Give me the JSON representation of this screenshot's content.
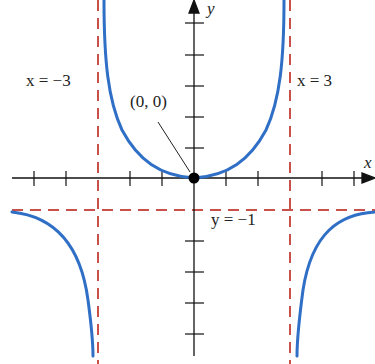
{
  "diagram": {
    "type": "function-graph",
    "function_description": "rational function with vertical asymptotes x = ±3 and horizontal asymptote y = -1, minimum at origin",
    "axes": {
      "x_label": "x",
      "y_label": "y"
    },
    "asymptotes": {
      "left_vertical": "x = −3",
      "right_vertical": "x = 3",
      "horizontal": "y = −1"
    },
    "point": {
      "label": "(0, 0)"
    },
    "colors": {
      "curve": "#2f6fc6",
      "asymptote": "#c0504d",
      "axis": "#111111"
    }
  }
}
